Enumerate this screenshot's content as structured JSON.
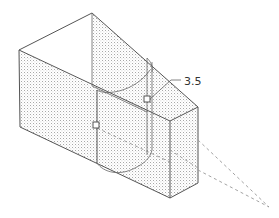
{
  "figure": {
    "type": "isometric technical drawing",
    "dimension_label": "3.5",
    "colors": {
      "background": "#ffffff",
      "edge": "#555555",
      "stipple": "#9a9a9a",
      "dashed": "#999999",
      "text": "#333333"
    }
  }
}
